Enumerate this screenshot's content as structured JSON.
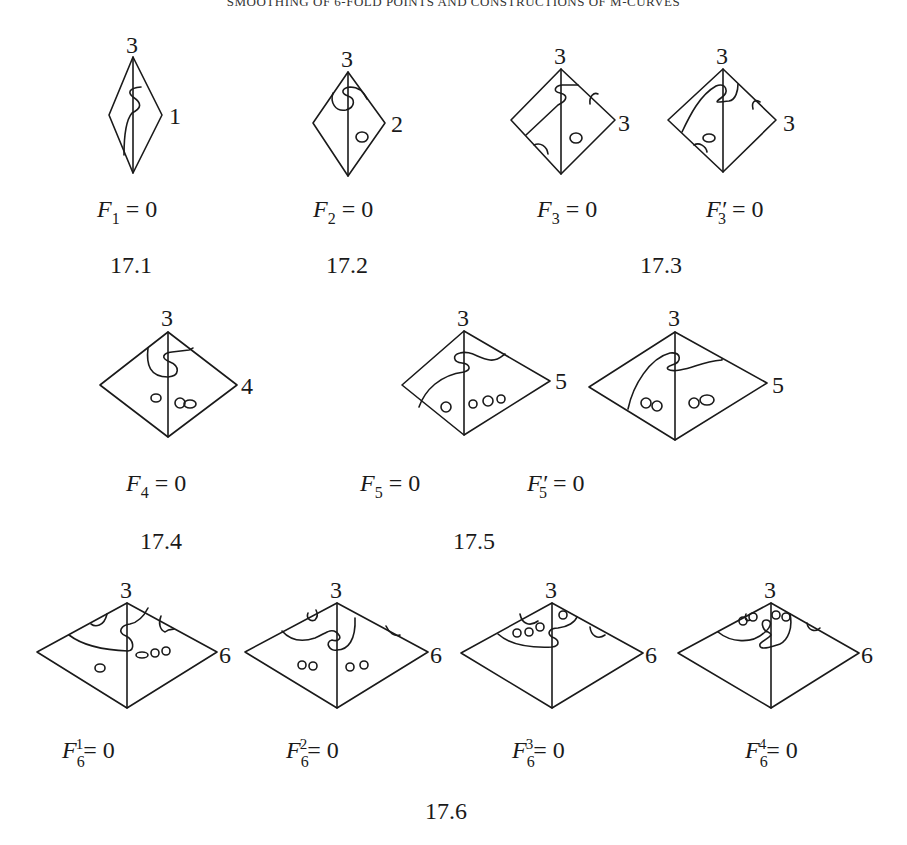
{
  "header": {
    "running_title": "SMOOTHING OF 6-FOLD POINTS AND CONSTRUCTIONS OF M-CURVES"
  },
  "figures": [
    {
      "id": "17.1",
      "caption": "17.1",
      "diagrams": [
        {
          "top_label": "3",
          "side_label": "1",
          "equation": {
            "base": "F",
            "sub": "1",
            "prime": "",
            "sup": "",
            "rest": " = 0"
          }
        }
      ]
    },
    {
      "id": "17.2",
      "caption": "17.2",
      "diagrams": [
        {
          "top_label": "3",
          "side_label": "2",
          "equation": {
            "base": "F",
            "sub": "2",
            "prime": "",
            "sup": "",
            "rest": " = 0"
          }
        }
      ]
    },
    {
      "id": "17.3",
      "caption": "17.3",
      "diagrams": [
        {
          "top_label": "3",
          "side_label": "3",
          "equation": {
            "base": "F",
            "sub": "3",
            "prime": "",
            "sup": "",
            "rest": " = 0"
          }
        },
        {
          "top_label": "3",
          "side_label": "3",
          "equation": {
            "base": "F",
            "sub": "3",
            "prime": "′",
            "sup": "",
            "rest": " = 0"
          }
        }
      ]
    },
    {
      "id": "17.4",
      "caption": "17.4",
      "diagrams": [
        {
          "top_label": "3",
          "side_label": "4",
          "equation": {
            "base": "F",
            "sub": "4",
            "prime": "",
            "sup": "",
            "rest": " = 0"
          }
        }
      ]
    },
    {
      "id": "17.5",
      "caption": "17.5",
      "diagrams": [
        {
          "top_label": "3",
          "side_label": "5",
          "equation": {
            "base": "F",
            "sub": "5",
            "prime": "",
            "sup": "",
            "rest": " = 0"
          }
        },
        {
          "top_label": "3",
          "side_label": "5",
          "equation": {
            "base": "F",
            "sub": "5",
            "prime": "′",
            "sup": "",
            "rest": " = 0"
          }
        }
      ]
    },
    {
      "id": "17.6",
      "caption": "17.6",
      "diagrams": [
        {
          "top_label": "3",
          "side_label": "6",
          "equation": {
            "base": "F",
            "sub": "6",
            "prime": "",
            "sup": "1",
            "rest": "= 0"
          }
        },
        {
          "top_label": "3",
          "side_label": "6",
          "equation": {
            "base": "F",
            "sub": "6",
            "prime": "",
            "sup": "2",
            "rest": "= 0"
          }
        },
        {
          "top_label": "3",
          "side_label": "6",
          "equation": {
            "base": "F",
            "sub": "6",
            "prime": "",
            "sup": "3",
            "rest": "= 0"
          }
        },
        {
          "top_label": "3",
          "side_label": "6",
          "equation": {
            "base": "F",
            "sub": "6",
            "prime": "",
            "sup": "4",
            "rest": "= 0"
          }
        }
      ]
    }
  ]
}
